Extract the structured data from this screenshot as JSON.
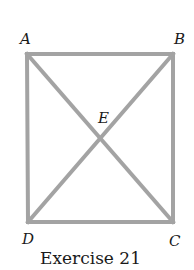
{
  "figure": {
    "caption": "Exercise 21",
    "line_color": "#a3a3a3",
    "text_color": "#1a1a1a",
    "points": {
      "A": {
        "label": "A"
      },
      "B": {
        "label": "B"
      },
      "C": {
        "label": "C"
      },
      "D": {
        "label": "D"
      },
      "E": {
        "label": "E"
      }
    },
    "shape": "square ABCD with diagonals AC and BD intersecting at E"
  }
}
